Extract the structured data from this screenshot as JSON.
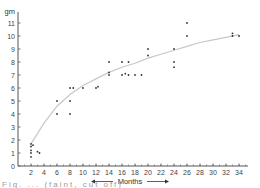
{
  "chart_data": {
    "type": "scatter",
    "title": "",
    "xlabel": "Months",
    "ylabel": "gm",
    "xlim": [
      0,
      36
    ],
    "ylim": [
      0,
      11.5
    ],
    "x_ticks": [
      2,
      4,
      6,
      8,
      10,
      12,
      14,
      16,
      18,
      20,
      22,
      24,
      26,
      28,
      30,
      32,
      34
    ],
    "y_ticks": [
      0,
      1,
      2,
      3,
      4,
      5,
      6,
      7,
      8,
      9,
      10,
      11
    ],
    "grid": false,
    "legend": null,
    "x_label_arrows": "both",
    "series": [
      {
        "name": "observations",
        "marker": "dot",
        "points": [
          {
            "x": 2,
            "y": 0.7
          },
          {
            "x": 2,
            "y": 1.0
          },
          {
            "x": 2,
            "y": 1.2
          },
          {
            "x": 2,
            "y": 1.5
          },
          {
            "x": 2,
            "y": 1.7
          },
          {
            "x": 2.3,
            "y": 1.6
          },
          {
            "x": 3,
            "y": 1.1
          },
          {
            "x": 3.3,
            "y": 1.0
          },
          {
            "x": 6,
            "y": 4
          },
          {
            "x": 6,
            "y": 5
          },
          {
            "x": 8,
            "y": 4
          },
          {
            "x": 8,
            "y": 5
          },
          {
            "x": 8,
            "y": 6
          },
          {
            "x": 8.5,
            "y": 6
          },
          {
            "x": 10,
            "y": 6
          },
          {
            "x": 12,
            "y": 6
          },
          {
            "x": 12.3,
            "y": 6.1
          },
          {
            "x": 14,
            "y": 7
          },
          {
            "x": 14,
            "y": 7.2
          },
          {
            "x": 14,
            "y": 8
          },
          {
            "x": 16,
            "y": 7
          },
          {
            "x": 16,
            "y": 8
          },
          {
            "x": 16.5,
            "y": 7.1
          },
          {
            "x": 17,
            "y": 8
          },
          {
            "x": 17,
            "y": 7
          },
          {
            "x": 18,
            "y": 7
          },
          {
            "x": 19,
            "y": 7
          },
          {
            "x": 20,
            "y": 8.5
          },
          {
            "x": 20,
            "y": 9
          },
          {
            "x": 24,
            "y": 7.6
          },
          {
            "x": 24,
            "y": 8
          },
          {
            "x": 24,
            "y": 9
          },
          {
            "x": 26,
            "y": 10
          },
          {
            "x": 26,
            "y": 11
          },
          {
            "x": 33,
            "y": 10
          },
          {
            "x": 33,
            "y": 10.2
          },
          {
            "x": 34,
            "y": 10
          }
        ]
      },
      {
        "name": "fitted curve",
        "type": "line",
        "style": "faint gray",
        "points": [
          {
            "x": 2,
            "y": 1.7
          },
          {
            "x": 4,
            "y": 3.3
          },
          {
            "x": 6,
            "y": 4.6
          },
          {
            "x": 8,
            "y": 5.5
          },
          {
            "x": 10,
            "y": 6.2
          },
          {
            "x": 12,
            "y": 6.7
          },
          {
            "x": 14,
            "y": 7.2
          },
          {
            "x": 16,
            "y": 7.6
          },
          {
            "x": 18,
            "y": 7.9
          },
          {
            "x": 20,
            "y": 8.3
          },
          {
            "x": 22,
            "y": 8.6
          },
          {
            "x": 24,
            "y": 8.9
          },
          {
            "x": 26,
            "y": 9.2
          },
          {
            "x": 28,
            "y": 9.5
          },
          {
            "x": 30,
            "y": 9.7
          },
          {
            "x": 32,
            "y": 9.9
          },
          {
            "x": 34,
            "y": 10.1
          }
        ]
      }
    ],
    "caption": "Fig. ... (faint, cut off)"
  },
  "colors": {
    "axis": "#555555",
    "points": "#333333",
    "curve": "#c8c8c8",
    "text": "#444444"
  }
}
